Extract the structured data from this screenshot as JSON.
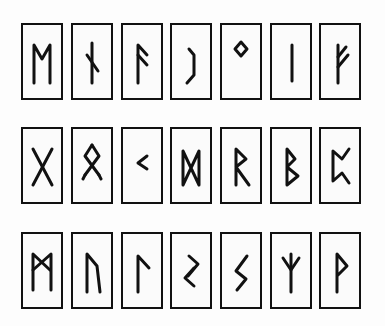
{
  "colors": {
    "ink": "#111111",
    "paper": "#fdfdfd"
  },
  "rows": [
    {
      "tiles": [
        {
          "rune": "ᛗ",
          "name": "Mannaz",
          "glyph": "M"
        },
        {
          "rune": "ᚾ",
          "name": "Nauthiz",
          "glyph": "N"
        },
        {
          "rune": "ᚨ",
          "name": "Ansuz",
          "glyph": "A"
        },
        {
          "rune": "ᛇ",
          "name": "Eihwaz",
          "glyph": "EI"
        },
        {
          "rune": "ᛜ",
          "name": "Ingwaz",
          "glyph": "NG"
        },
        {
          "rune": "ᛁ",
          "name": "Isa",
          "glyph": "I"
        },
        {
          "rune": "ᚠ",
          "name": "Fehu",
          "glyph": "F"
        }
      ]
    },
    {
      "tiles": [
        {
          "rune": "ᚷ",
          "name": "Gebo",
          "glyph": "G"
        },
        {
          "rune": "ᛟ",
          "name": "Othala",
          "glyph": "O"
        },
        {
          "rune": "ᚲ",
          "name": "Kenaz",
          "glyph": "K"
        },
        {
          "rune": "ᛞ",
          "name": "Dagaz",
          "glyph": "D"
        },
        {
          "rune": "ᚱ",
          "name": "Raidho",
          "glyph": "R"
        },
        {
          "rune": "ᛒ",
          "name": "Berkano",
          "glyph": "B"
        },
        {
          "rune": "ᛈ",
          "name": "Perthro",
          "glyph": "P"
        }
      ]
    },
    {
      "tiles": [
        {
          "rune": "ᛖ",
          "name": "Ehwaz",
          "glyph": "E"
        },
        {
          "rune": "ᚢ",
          "name": "Uruz",
          "glyph": "U"
        },
        {
          "rune": "ᛚ",
          "name": "Laguz",
          "glyph": "L"
        },
        {
          "rune": "ᛊ",
          "name": "Sowilo (variant)",
          "glyph": "S2"
        },
        {
          "rune": "ᛊ",
          "name": "Sowilo",
          "glyph": "S"
        },
        {
          "rune": "ᛉ",
          "name": "Algiz",
          "glyph": "Z"
        },
        {
          "rune": "ᚹ",
          "name": "Wunjo",
          "glyph": "W"
        }
      ]
    }
  ]
}
